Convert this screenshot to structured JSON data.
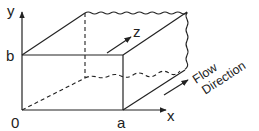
{
  "diagram": {
    "type": "3d-channel-coordinate-box",
    "axes": {
      "x": "x",
      "y": "y",
      "z": "z"
    },
    "ticks": {
      "origin": "0",
      "x_extent": "a",
      "y_extent": "b"
    },
    "annotation": {
      "line1": "Flow",
      "line2": "Direction"
    },
    "colors": {
      "stroke": "#222222",
      "background": "#ffffff"
    }
  }
}
